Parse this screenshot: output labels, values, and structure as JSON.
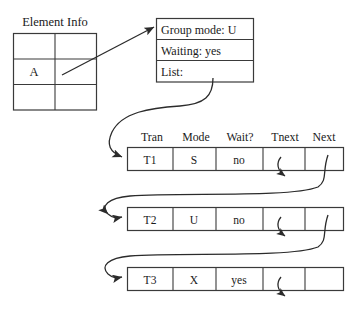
{
  "element_info": {
    "label": "Element Info",
    "rows": 3,
    "cols": 2,
    "cells": [
      [
        "",
        ""
      ],
      [
        "A",
        ""
      ],
      [
        "",
        ""
      ]
    ],
    "filled_cell": "A"
  },
  "group_block": {
    "lines": [
      "Group mode: U",
      "Waiting: yes",
      "List:"
    ],
    "group_mode_label": "Group mode:",
    "group_mode_value": "U",
    "waiting_label": "Waiting:",
    "waiting_value": "yes",
    "list_label": "List:"
  },
  "tran_table": {
    "headers": [
      "Tran",
      "Mode",
      "Wait?",
      "Tnext",
      "Next"
    ],
    "rows": [
      {
        "tran": "T1",
        "mode": "S",
        "wait": "no",
        "tnext": "",
        "next": ""
      },
      {
        "tran": "T2",
        "mode": "U",
        "wait": "no",
        "tnext": "",
        "next": ""
      },
      {
        "tran": "T3",
        "mode": "X",
        "wait": "yes",
        "tnext": "",
        "next": ""
      }
    ]
  },
  "colors": {
    "line": "#3a3a3a",
    "curve": "#2b2b2b",
    "text": "#1a1a1a",
    "background": "#ffffff"
  }
}
